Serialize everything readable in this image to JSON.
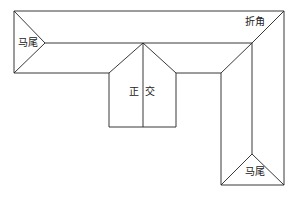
{
  "diagram": {
    "type": "roof-plan",
    "labels": {
      "horse_tail_left": "马尾",
      "corner": "折角",
      "orthogonal_left": "正",
      "orthogonal_right": "交",
      "horse_tail_bottom": "马尾"
    },
    "stroke_color": "#222222",
    "background": "#ffffff"
  }
}
